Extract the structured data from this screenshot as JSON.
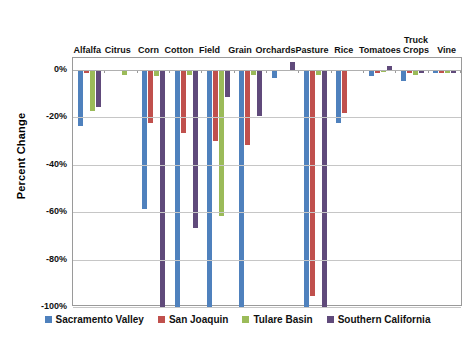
{
  "chart_data": {
    "type": "bar",
    "title": "",
    "xlabel": "",
    "ylabel": "Percent Change",
    "ylim": [
      -100,
      5
    ],
    "grid": true,
    "legend_position": "bottom",
    "yticks": [
      "0%",
      "-20%",
      "-40%",
      "-60%",
      "-80%",
      "-100%"
    ],
    "ytick_values": [
      0,
      -20,
      -40,
      -60,
      -80,
      -100
    ],
    "categories": [
      "Alfalfa",
      "Citrus",
      "Corn",
      "Cotton",
      "Field",
      "Grain",
      "Orchards",
      "Pasture",
      "Rice",
      "Tomatoes",
      "Truck\nCrops",
      "Vine"
    ],
    "colors": {
      "Sacramento Valley": "#4f81bd",
      "San Joaquin": "#c0504d",
      "Tulare Basin": "#9bbb59",
      "Southern California": "#604a7b"
    },
    "series": [
      {
        "name": "Sacramento Valley",
        "color": "#4f81bd",
        "values": [
          -23.5,
          0,
          -58.5,
          -100,
          -100,
          -100,
          -3.5,
          -100,
          -22.5,
          -2.5,
          -4.5,
          -1.5
        ]
      },
      {
        "name": "San Joaquin",
        "color": "#c0504d",
        "values": [
          -1.5,
          0,
          -22.5,
          -26.5,
          -30.0,
          -31.5,
          0,
          -95.5,
          -18.0,
          -1.5,
          -1.5,
          -1.5
        ]
      },
      {
        "name": "Tulare Basin",
        "color": "#9bbb59",
        "values": [
          -17.5,
          -2.0,
          -2.5,
          -2.0,
          -61.5,
          -2.0,
          0,
          -2.0,
          0,
          -1.0,
          -2.0,
          -1.5
        ]
      },
      {
        "name": "Southern California",
        "color": "#604a7b",
        "values": [
          -15.5,
          0,
          -100,
          -66.5,
          -11.5,
          -19.5,
          3.5,
          -100,
          0,
          1.5,
          -1.5,
          -1.5
        ]
      }
    ]
  },
  "legend": {
    "items": [
      {
        "label": "Sacramento Valley",
        "color": "#4f81bd"
      },
      {
        "label": "San Joaquin",
        "color": "#c0504d"
      },
      {
        "label": "Tulare Basin",
        "color": "#9bbb59"
      },
      {
        "label": "Southern California",
        "color": "#604a7b"
      }
    ]
  }
}
